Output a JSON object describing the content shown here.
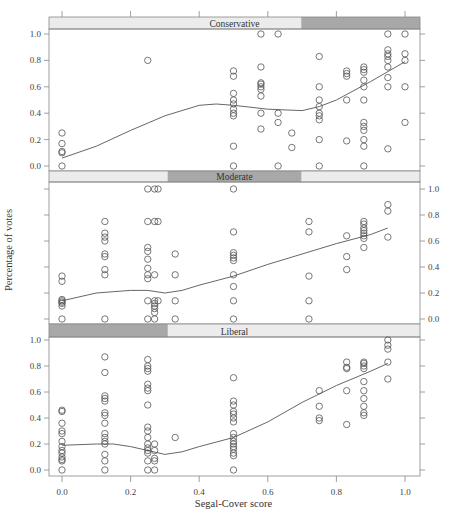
{
  "chart_data": {
    "type": "scatter",
    "subtype": "lattice scatter with loess smoother",
    "xlabel": "Segal-Cover score",
    "ylabel": "Percentage of votes",
    "xlim": [
      0.0,
      1.0
    ],
    "ylim": [
      0.0,
      1.0
    ],
    "x_ticks": [
      "0.0",
      "0.2",
      "0.4",
      "0.6",
      "0.8",
      "1.0"
    ],
    "y_ticks": [
      "0.0",
      "0.2",
      "0.4",
      "0.6",
      "0.8",
      "1.0"
    ],
    "grid": false,
    "colors": {
      "points": "#555555",
      "curve": "#555555",
      "strip_light": "#ececec",
      "strip_dark": "#a8a8a8",
      "frame": "#888888"
    },
    "panels": [
      {
        "name": "Conservative",
        "strip_dark_range": [
          0.68,
          1.0
        ],
        "y_axis_side": "left",
        "points": [
          [
            0.0,
            0.25
          ],
          [
            0.0,
            0.17
          ],
          [
            0.0,
            0.11
          ],
          [
            0.0,
            0.1
          ],
          [
            0.0,
            0.0
          ],
          [
            0.25,
            0.8
          ],
          [
            0.5,
            0.72
          ],
          [
            0.5,
            0.68
          ],
          [
            0.5,
            0.55
          ],
          [
            0.5,
            0.5
          ],
          [
            0.5,
            0.47
          ],
          [
            0.5,
            0.43
          ],
          [
            0.5,
            0.4
          ],
          [
            0.5,
            0.38
          ],
          [
            0.5,
            0.15
          ],
          [
            0.5,
            0.0
          ],
          [
            0.58,
            1.0
          ],
          [
            0.58,
            0.75
          ],
          [
            0.58,
            0.63
          ],
          [
            0.58,
            0.62
          ],
          [
            0.58,
            0.6
          ],
          [
            0.58,
            0.58
          ],
          [
            0.58,
            0.53
          ],
          [
            0.58,
            0.4
          ],
          [
            0.58,
            0.28
          ],
          [
            0.63,
            1.0
          ],
          [
            0.63,
            0.4
          ],
          [
            0.63,
            0.33
          ],
          [
            0.63,
            0.0
          ],
          [
            0.67,
            0.25
          ],
          [
            0.67,
            0.14
          ],
          [
            0.75,
            0.83
          ],
          [
            0.75,
            0.6
          ],
          [
            0.75,
            0.5
          ],
          [
            0.75,
            0.45
          ],
          [
            0.75,
            0.4
          ],
          [
            0.75,
            0.38
          ],
          [
            0.75,
            0.35
          ],
          [
            0.75,
            0.2
          ],
          [
            0.75,
            0.0
          ],
          [
            0.83,
            0.72
          ],
          [
            0.83,
            0.7
          ],
          [
            0.83,
            0.68
          ],
          [
            0.83,
            0.5
          ],
          [
            0.83,
            0.19
          ],
          [
            0.88,
            0.75
          ],
          [
            0.88,
            0.73
          ],
          [
            0.88,
            0.71
          ],
          [
            0.88,
            0.65
          ],
          [
            0.88,
            0.6
          ],
          [
            0.88,
            0.5
          ],
          [
            0.88,
            0.33
          ],
          [
            0.88,
            0.3
          ],
          [
            0.88,
            0.27
          ],
          [
            0.88,
            0.2
          ],
          [
            0.88,
            0.15
          ],
          [
            0.88,
            0.0
          ],
          [
            0.95,
            1.0
          ],
          [
            0.95,
            0.88
          ],
          [
            0.95,
            0.85
          ],
          [
            0.95,
            0.83
          ],
          [
            0.95,
            0.8
          ],
          [
            0.95,
            0.75
          ],
          [
            0.95,
            0.67
          ],
          [
            0.95,
            0.6
          ],
          [
            0.95,
            0.13
          ],
          [
            1.0,
            1.0
          ],
          [
            1.0,
            0.85
          ],
          [
            1.0,
            0.8
          ],
          [
            1.0,
            0.6
          ],
          [
            1.0,
            0.33
          ]
        ],
        "curve": [
          [
            0.0,
            0.06
          ],
          [
            0.1,
            0.15
          ],
          [
            0.2,
            0.27
          ],
          [
            0.3,
            0.38
          ],
          [
            0.4,
            0.46
          ],
          [
            0.45,
            0.47
          ],
          [
            0.5,
            0.46
          ],
          [
            0.6,
            0.43
          ],
          [
            0.7,
            0.42
          ],
          [
            0.75,
            0.45
          ],
          [
            0.8,
            0.5
          ],
          [
            0.9,
            0.64
          ],
          [
            1.0,
            0.79
          ]
        ]
      },
      {
        "name": "Moderate",
        "strip_dark_range": [
          0.32,
          0.68
        ],
        "y_axis_side": "right",
        "points": [
          [
            0.0,
            0.33
          ],
          [
            0.0,
            0.29
          ],
          [
            0.0,
            0.15
          ],
          [
            0.0,
            0.14
          ],
          [
            0.0,
            0.13
          ],
          [
            0.0,
            0.12
          ],
          [
            0.0,
            0.1
          ],
          [
            0.0,
            0.0
          ],
          [
            0.125,
            0.75
          ],
          [
            0.125,
            0.66
          ],
          [
            0.125,
            0.63
          ],
          [
            0.125,
            0.6
          ],
          [
            0.125,
            0.5
          ],
          [
            0.125,
            0.48
          ],
          [
            0.125,
            0.38
          ],
          [
            0.125,
            0.34
          ],
          [
            0.125,
            0.0
          ],
          [
            0.25,
            1.0
          ],
          [
            0.25,
            0.75
          ],
          [
            0.25,
            0.55
          ],
          [
            0.25,
            0.52
          ],
          [
            0.25,
            0.46
          ],
          [
            0.25,
            0.39
          ],
          [
            0.25,
            0.34
          ],
          [
            0.25,
            0.31
          ],
          [
            0.25,
            0.14
          ],
          [
            0.25,
            0.0
          ],
          [
            0.27,
            1.0
          ],
          [
            0.27,
            0.75
          ],
          [
            0.27,
            0.34
          ],
          [
            0.27,
            0.14
          ],
          [
            0.27,
            0.12
          ],
          [
            0.27,
            0.1
          ],
          [
            0.27,
            0.08
          ],
          [
            0.27,
            0.05
          ],
          [
            0.27,
            0.0
          ],
          [
            0.28,
            1.0
          ],
          [
            0.28,
            0.75
          ],
          [
            0.28,
            0.14
          ],
          [
            0.33,
            0.5
          ],
          [
            0.33,
            0.34
          ],
          [
            0.33,
            0.14
          ],
          [
            0.33,
            0.0
          ],
          [
            0.5,
            1.0
          ],
          [
            0.5,
            0.67
          ],
          [
            0.5,
            0.51
          ],
          [
            0.5,
            0.49
          ],
          [
            0.5,
            0.47
          ],
          [
            0.5,
            0.45
          ],
          [
            0.5,
            0.34
          ],
          [
            0.5,
            0.25
          ],
          [
            0.5,
            0.14
          ],
          [
            0.5,
            0.0
          ],
          [
            0.72,
            0.75
          ],
          [
            0.72,
            0.67
          ],
          [
            0.72,
            0.33
          ],
          [
            0.72,
            0.14
          ],
          [
            0.72,
            0.0
          ],
          [
            0.83,
            0.64
          ],
          [
            0.83,
            0.48
          ],
          [
            0.83,
            0.38
          ],
          [
            0.88,
            0.75
          ],
          [
            0.88,
            0.73
          ],
          [
            0.88,
            0.7
          ],
          [
            0.88,
            0.68
          ],
          [
            0.88,
            0.66
          ],
          [
            0.88,
            0.64
          ],
          [
            0.88,
            0.62
          ],
          [
            0.88,
            0.55
          ],
          [
            0.95,
            0.88
          ],
          [
            0.95,
            0.83
          ],
          [
            0.95,
            0.63
          ]
        ],
        "curve": [
          [
            0.0,
            0.14
          ],
          [
            0.1,
            0.2
          ],
          [
            0.2,
            0.22
          ],
          [
            0.25,
            0.22
          ],
          [
            0.3,
            0.2
          ],
          [
            0.35,
            0.22
          ],
          [
            0.4,
            0.26
          ],
          [
            0.5,
            0.33
          ],
          [
            0.6,
            0.42
          ],
          [
            0.7,
            0.5
          ],
          [
            0.8,
            0.58
          ],
          [
            0.9,
            0.65
          ],
          [
            0.95,
            0.7
          ]
        ]
      },
      {
        "name": "Liberal",
        "strip_dark_range": [
          0.0,
          0.32
        ],
        "y_axis_side": "left",
        "points": [
          [
            0.0,
            0.46
          ],
          [
            0.0,
            0.45
          ],
          [
            0.0,
            0.36
          ],
          [
            0.0,
            0.3
          ],
          [
            0.0,
            0.28
          ],
          [
            0.0,
            0.22
          ],
          [
            0.0,
            0.18
          ],
          [
            0.0,
            0.15
          ],
          [
            0.0,
            0.13
          ],
          [
            0.0,
            0.1
          ],
          [
            0.0,
            0.08
          ],
          [
            0.0,
            0.07
          ],
          [
            0.0,
            0.0
          ],
          [
            0.125,
            0.87
          ],
          [
            0.125,
            0.75
          ],
          [
            0.125,
            0.57
          ],
          [
            0.125,
            0.55
          ],
          [
            0.125,
            0.53
          ],
          [
            0.125,
            0.44
          ],
          [
            0.125,
            0.42
          ],
          [
            0.125,
            0.36
          ],
          [
            0.125,
            0.28
          ],
          [
            0.125,
            0.25
          ],
          [
            0.125,
            0.22
          ],
          [
            0.125,
            0.2
          ],
          [
            0.125,
            0.12
          ],
          [
            0.125,
            0.07
          ],
          [
            0.125,
            0.0
          ],
          [
            0.25,
            0.85
          ],
          [
            0.25,
            0.8
          ],
          [
            0.25,
            0.78
          ],
          [
            0.25,
            0.76
          ],
          [
            0.25,
            0.66
          ],
          [
            0.25,
            0.63
          ],
          [
            0.25,
            0.61
          ],
          [
            0.25,
            0.5
          ],
          [
            0.25,
            0.33
          ],
          [
            0.25,
            0.3
          ],
          [
            0.25,
            0.25
          ],
          [
            0.25,
            0.2
          ],
          [
            0.25,
            0.17
          ],
          [
            0.25,
            0.15
          ],
          [
            0.25,
            0.13
          ],
          [
            0.25,
            0.07
          ],
          [
            0.25,
            0.0
          ],
          [
            0.27,
            0.2
          ],
          [
            0.27,
            0.15
          ],
          [
            0.27,
            0.09
          ],
          [
            0.27,
            0.07
          ],
          [
            0.27,
            0.0
          ],
          [
            0.33,
            0.25
          ],
          [
            0.5,
            0.71
          ],
          [
            0.5,
            0.53
          ],
          [
            0.5,
            0.5
          ],
          [
            0.5,
            0.45
          ],
          [
            0.5,
            0.43
          ],
          [
            0.5,
            0.4
          ],
          [
            0.5,
            0.37
          ],
          [
            0.5,
            0.28
          ],
          [
            0.5,
            0.25
          ],
          [
            0.5,
            0.22
          ],
          [
            0.5,
            0.2
          ],
          [
            0.5,
            0.18
          ],
          [
            0.5,
            0.16
          ],
          [
            0.5,
            0.13
          ],
          [
            0.5,
            0.11
          ],
          [
            0.5,
            0.0
          ],
          [
            0.75,
            0.61
          ],
          [
            0.75,
            0.49
          ],
          [
            0.75,
            0.4
          ],
          [
            0.75,
            0.38
          ],
          [
            0.83,
            0.83
          ],
          [
            0.83,
            0.79
          ],
          [
            0.83,
            0.78
          ],
          [
            0.83,
            0.61
          ],
          [
            0.83,
            0.35
          ],
          [
            0.88,
            0.83
          ],
          [
            0.88,
            0.82
          ],
          [
            0.88,
            0.8
          ],
          [
            0.88,
            0.78
          ],
          [
            0.88,
            0.68
          ],
          [
            0.88,
            0.61
          ],
          [
            0.88,
            0.55
          ],
          [
            0.88,
            0.49
          ],
          [
            0.88,
            0.44
          ],
          [
            0.88,
            0.42
          ],
          [
            0.95,
            1.0
          ],
          [
            0.95,
            0.96
          ],
          [
            0.95,
            0.93
          ],
          [
            0.95,
            0.83
          ],
          [
            0.95,
            0.7
          ]
        ],
        "curve": [
          [
            0.0,
            0.19
          ],
          [
            0.1,
            0.2
          ],
          [
            0.15,
            0.2
          ],
          [
            0.2,
            0.18
          ],
          [
            0.25,
            0.15
          ],
          [
            0.3,
            0.12
          ],
          [
            0.35,
            0.14
          ],
          [
            0.4,
            0.18
          ],
          [
            0.5,
            0.25
          ],
          [
            0.6,
            0.37
          ],
          [
            0.7,
            0.52
          ],
          [
            0.8,
            0.65
          ],
          [
            0.9,
            0.76
          ],
          [
            0.95,
            0.82
          ]
        ]
      }
    ]
  },
  "caption_partial": "FIGURE 1 (partially visible caption)"
}
